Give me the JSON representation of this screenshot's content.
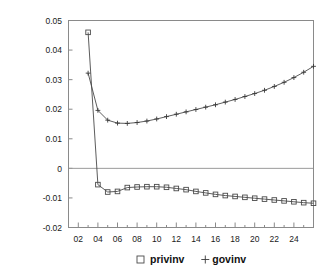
{
  "chart_data": {
    "type": "line",
    "title": "",
    "subtitle": "",
    "xlabel": "",
    "ylabel": "",
    "xlim": [
      1,
      26
    ],
    "ylim": [
      -0.02,
      0.05
    ],
    "grid": false,
    "zero_line": true,
    "legend_position": "bottom",
    "y_ticks": [
      "0.05",
      "0.04",
      "0.03",
      "0.02",
      "0.01",
      "0",
      "-0.01",
      "-0.02"
    ],
    "y_tick_values": [
      0.05,
      0.04,
      0.03,
      0.02,
      0.01,
      0,
      -0.01,
      -0.02
    ],
    "x_ticks": [
      "02",
      "04",
      "06",
      "08",
      "10",
      "12",
      "14",
      "16",
      "18",
      "20",
      "22",
      "24"
    ],
    "x_tick_values": [
      2,
      4,
      6,
      8,
      10,
      12,
      14,
      16,
      18,
      20,
      22,
      24
    ],
    "x": [
      3,
      4,
      5,
      6,
      7,
      8,
      9,
      10,
      11,
      12,
      13,
      14,
      15,
      16,
      17,
      18,
      19,
      20,
      21,
      22,
      23,
      24,
      25,
      26
    ],
    "series": [
      {
        "name": "privinv",
        "marker": "square",
        "values": [
          0.046,
          -0.0055,
          -0.008,
          -0.0078,
          -0.0065,
          -0.0063,
          -0.0062,
          -0.0062,
          -0.0064,
          -0.0068,
          -0.0072,
          -0.0078,
          -0.0083,
          -0.0088,
          -0.0092,
          -0.0095,
          -0.0098,
          -0.0101,
          -0.0104,
          -0.0107,
          -0.011,
          -0.0113,
          -0.0116,
          -0.0118
        ]
      },
      {
        "name": "govinv",
        "marker": "plus",
        "values": [
          0.0322,
          0.0196,
          0.0163,
          0.0153,
          0.0152,
          0.0155,
          0.016,
          0.0167,
          0.0175,
          0.0183,
          0.0191,
          0.0199,
          0.0207,
          0.0215,
          0.0224,
          0.0233,
          0.0243,
          0.0253,
          0.0264,
          0.0277,
          0.0291,
          0.0307,
          0.0325,
          0.0345
        ]
      }
    ],
    "legend": [
      {
        "label": "privinv",
        "marker": "square"
      },
      {
        "label": "govinv",
        "marker": "plus"
      }
    ],
    "colors": {
      "line": "#4a4a4a",
      "frame": "#8a8a8a",
      "text": "#1a1a1a",
      "background": "#ffffff"
    }
  }
}
